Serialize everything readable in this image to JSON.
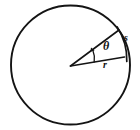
{
  "figure": {
    "type": "geometry-diagram",
    "background_color": "#ffffff",
    "stroke_color": "#141414",
    "canvas": {
      "width": 140,
      "height": 130
    }
  },
  "circle": {
    "name": "circle",
    "center_x": 70.5,
    "center_y": 65.0,
    "radius": 59.5,
    "stroke_width": 1.9,
    "fill": "none"
  },
  "sector": {
    "vertex_x": 70.5,
    "vertex_y": 66.0,
    "upper_radius_end_x": 119.0,
    "upper_radius_end_y": 30.0,
    "lower_radius_end_x": 124.5,
    "lower_radius_end_y": 57.0,
    "arc_radius": 60.0,
    "stroke_width": 1.6
  },
  "labels": {
    "theta": {
      "text": "θ",
      "x": 106,
      "y": 47,
      "font_size": 12,
      "role": "central-angle"
    },
    "arc": {
      "text": "s",
      "x": 126,
      "y": 39,
      "font_size": 10,
      "role": "arc-length"
    },
    "radius": {
      "text": "r",
      "x": 105,
      "y": 66,
      "font_size": 10,
      "role": "radius"
    }
  },
  "angle_marker": {
    "name": "angle-arc-marker",
    "radius": 24,
    "stroke_width": 1.3
  }
}
